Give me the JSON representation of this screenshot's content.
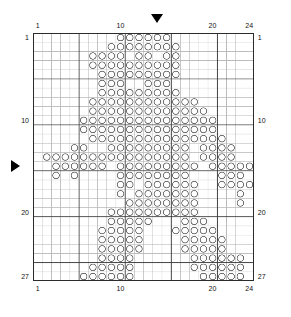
{
  "chart_data": {
    "type": "table",
    "title": "",
    "xlabel": "",
    "ylabel": "",
    "grid": true,
    "columns": 24,
    "rows": 27,
    "heavy_line_every": 5,
    "symbol": "circle",
    "legend": [],
    "axis": {
      "top_ticks": [
        {
          "value": 1,
          "label": "1"
        },
        {
          "value": 10,
          "label": "10"
        },
        {
          "value": 20,
          "label": "20"
        },
        {
          "value": 24,
          "label": "24"
        }
      ],
      "bottom_ticks": [
        {
          "value": 1,
          "label": "1"
        },
        {
          "value": 10,
          "label": "10"
        },
        {
          "value": 20,
          "label": "20"
        },
        {
          "value": 24,
          "label": "24"
        }
      ],
      "left_ticks": [
        {
          "value": 1,
          "label": "1"
        },
        {
          "value": 10,
          "label": "10"
        },
        {
          "value": 20,
          "label": "20"
        },
        {
          "value": 27,
          "label": "27"
        }
      ],
      "right_ticks": [
        {
          "value": 1,
          "label": "1"
        },
        {
          "value": 10,
          "label": "10"
        },
        {
          "value": 20,
          "label": "20"
        },
        {
          "value": 27,
          "label": "27"
        }
      ]
    },
    "markers": [
      {
        "name": "column-marker",
        "orientation": "down",
        "column": 14
      },
      {
        "name": "row-marker",
        "orientation": "right",
        "row": 15
      }
    ],
    "filled_cells": [
      {
        "row": 1,
        "cols": [
          10,
          11,
          12,
          13,
          14,
          15
        ]
      },
      {
        "row": 2,
        "cols": [
          9,
          10,
          11,
          12,
          13,
          14,
          15,
          16
        ]
      },
      {
        "row": 3,
        "cols": [
          7,
          8,
          9,
          10,
          12,
          13,
          15,
          16
        ]
      },
      {
        "row": 4,
        "cols": [
          7,
          8,
          9,
          10,
          11,
          12,
          13,
          14,
          15,
          16
        ]
      },
      {
        "row": 5,
        "cols": [
          8,
          9,
          10,
          11,
          12,
          13,
          14,
          15,
          16
        ]
      },
      {
        "row": 6,
        "cols": [
          8,
          9,
          10,
          13,
          14,
          15
        ]
      },
      {
        "row": 7,
        "cols": [
          8,
          9,
          10,
          11,
          12,
          13,
          14,
          15,
          16
        ]
      },
      {
        "row": 8,
        "cols": [
          7,
          8,
          9,
          10,
          11,
          12,
          13,
          14,
          15,
          16,
          17,
          18
        ]
      },
      {
        "row": 9,
        "cols": [
          7,
          8,
          9,
          10,
          11,
          12,
          13,
          14,
          15,
          16,
          17,
          18,
          19
        ]
      },
      {
        "row": 10,
        "cols": [
          6,
          7,
          8,
          9,
          10,
          11,
          12,
          13,
          14,
          15,
          16,
          17,
          18,
          19,
          20
        ]
      },
      {
        "row": 11,
        "cols": [
          6,
          7,
          8,
          9,
          10,
          11,
          12,
          13,
          14,
          15,
          16,
          17,
          18,
          19,
          20
        ]
      },
      {
        "row": 12,
        "cols": [
          7,
          8,
          9,
          10,
          11,
          12,
          13,
          14,
          15,
          16,
          17,
          18,
          19,
          20,
          21
        ]
      },
      {
        "row": 13,
        "cols": [
          5,
          6,
          9,
          10,
          11,
          12,
          13,
          14,
          15,
          16,
          17,
          19,
          20,
          21,
          22
        ]
      },
      {
        "row": 14,
        "cols": [
          2,
          3,
          4,
          5,
          6,
          7,
          8,
          9,
          10,
          11,
          12,
          13,
          14,
          15,
          16,
          17,
          19,
          20,
          21,
          22
        ]
      },
      {
        "row": 15,
        "cols": [
          3,
          4,
          5,
          6,
          7,
          8,
          10,
          11,
          12,
          13,
          14,
          15,
          16,
          17,
          18,
          20,
          21,
          22,
          23,
          24
        ]
      },
      {
        "row": 16,
        "cols": [
          3,
          5,
          10,
          11,
          12,
          13,
          14,
          15,
          16,
          17,
          21,
          22,
          23
        ]
      },
      {
        "row": 17,
        "cols": [
          10,
          11,
          13,
          14,
          15,
          16,
          17,
          18,
          21,
          22,
          23,
          24
        ]
      },
      {
        "row": 18,
        "cols": [
          10,
          12,
          13,
          14,
          15,
          16,
          17,
          18,
          23
        ]
      },
      {
        "row": 19,
        "cols": [
          11,
          12,
          13,
          14,
          15,
          16,
          17,
          18,
          23
        ]
      },
      {
        "row": 20,
        "cols": [
          9,
          10,
          11,
          12,
          13,
          14,
          15,
          16,
          17,
          18
        ]
      },
      {
        "row": 21,
        "cols": [
          9,
          10,
          11,
          12,
          13,
          17,
          18,
          19
        ]
      },
      {
        "row": 22,
        "cols": [
          8,
          9,
          10,
          11,
          12,
          16,
          17,
          18,
          19,
          20
        ]
      },
      {
        "row": 23,
        "cols": [
          8,
          9,
          10,
          11,
          12,
          17,
          18,
          19,
          20,
          21
        ]
      },
      {
        "row": 24,
        "cols": [
          8,
          9,
          10,
          11,
          12,
          17,
          18,
          19,
          20,
          21
        ]
      },
      {
        "row": 25,
        "cols": [
          8,
          9,
          10,
          11,
          18,
          19,
          20,
          21,
          22,
          23
        ]
      },
      {
        "row": 26,
        "cols": [
          7,
          8,
          9,
          10,
          11,
          18,
          19,
          20,
          21,
          22,
          23
        ]
      },
      {
        "row": 27,
        "cols": [
          6,
          7,
          8,
          9,
          10,
          11,
          19,
          20,
          21,
          22,
          23
        ]
      }
    ]
  },
  "style": {
    "grid_line_color": "#b9b9b9",
    "heavy_line_color": "#3a3a3a",
    "border_color": "#2b2b2b",
    "symbol_color": "#6e6e6e",
    "background": "#ffffff",
    "label_color": "#111111"
  }
}
